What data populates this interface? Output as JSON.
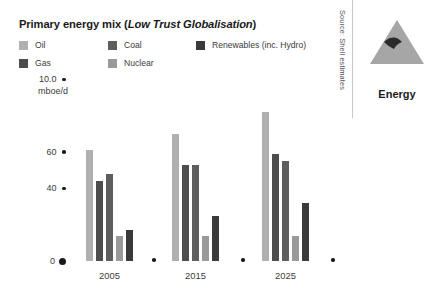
{
  "chart_data": {
    "type": "bar",
    "title": "Primary energy mix (Low Trust Globalisation)",
    "title_main": "Primary energy mix (",
    "title_scenario": "Low Trust Globalisation",
    "title_close": ")",
    "xlabel": "",
    "ylabel": "mboe/d",
    "unit_label": "mboe/d",
    "categories": [
      "2005",
      "2015",
      "2025"
    ],
    "ytick_labels": [
      "10.0",
      "60",
      "40",
      "0"
    ],
    "ytick_values": [
      100,
      60,
      40,
      0
    ],
    "ylim": [
      0,
      100
    ],
    "grid": false,
    "legend_position": "top",
    "series": [
      {
        "name": "Oil",
        "color": "#b0b0b0",
        "values": [
          61,
          70,
          82
        ]
      },
      {
        "name": "Gas",
        "color": "#4d4d4d",
        "values": [
          44,
          53,
          59
        ]
      },
      {
        "name": "Coal",
        "color": "#5e5e5e",
        "values": [
          48,
          53,
          55
        ]
      },
      {
        "name": "Nuclear",
        "color": "#9a9a9a",
        "values": [
          14,
          14,
          14
        ]
      },
      {
        "name": "Renewables (inc. Hydro)",
        "color": "#3a3a3a",
        "values": [
          17,
          25,
          32
        ]
      }
    ]
  },
  "legend": {
    "items": [
      {
        "label": "Oil",
        "color": "#b0b0b0"
      },
      {
        "label": "Gas",
        "color": "#4d4d4d"
      },
      {
        "label": "Coal",
        "color": "#5e5e5e"
      },
      {
        "label": "Nuclear",
        "color": "#9a9a9a"
      },
      {
        "label": "Renewables (inc. Hydro)",
        "color": "#3a3a3a"
      }
    ]
  },
  "rail": {
    "source": "Source: Shell estimates",
    "logo_caption": "Energy",
    "logo_name": "shell-pecten-triangle",
    "logo_color": "#a6a6a6",
    "logo_accent": "#2b2b2b"
  },
  "colors": {
    "text": "#231f20",
    "axis_text": "#3b3b3b",
    "tick_dot": "#1a1a1a",
    "rule": "#c8c8c8",
    "background": "#ffffff"
  }
}
